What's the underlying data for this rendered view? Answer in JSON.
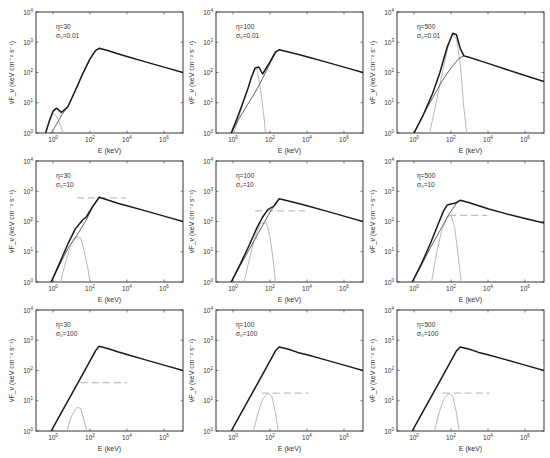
{
  "figure": {
    "xlabel": "E (keV)",
    "ylabel": "νF_ν (keV cm⁻² s⁻¹)",
    "x_ticks": [
      0,
      2,
      4,
      6
    ],
    "y_ticks": [
      0,
      1,
      2,
      3,
      4
    ],
    "xlim_log": [
      -0.92,
      7.03
    ],
    "ylim_log": [
      0,
      4
    ],
    "colors": {
      "total": "#1a1a1a",
      "component": "#555555",
      "thermal": "#b0b0b0",
      "dashed": "#c0c0c0",
      "axes": "#333333"
    }
  },
  "chart_data": [
    {
      "type": "line",
      "title": "",
      "row": 0,
      "col": 0,
      "label_eta": "η=30",
      "label_sigma": "σ₀=0.01",
      "xlabel": "E (keV)",
      "ylabel": "νFν (keV cm^-2 s^-1)",
      "xscale": "log",
      "yscale": "log",
      "xlim": [
        0.12,
        10000000.0
      ],
      "ylim": [
        1,
        10000
      ],
      "series": [
        {
          "name": "total",
          "x_log": [
            -0.4,
            -0.2,
            0.0,
            0.2,
            0.45,
            0.8,
            1.2,
            1.6,
            2.0,
            2.3,
            2.5,
            3.0,
            3.5,
            4.0,
            5.0,
            6.0,
            7.03
          ],
          "y_log": [
            0,
            0.4,
            0.72,
            0.82,
            0.68,
            0.86,
            1.4,
            1.95,
            2.45,
            2.72,
            2.8,
            2.72,
            2.62,
            2.53,
            2.35,
            2.18,
            2.0
          ]
        },
        {
          "name": "nonthermal",
          "x_log": [
            -0.1,
            0.2,
            0.5,
            0.8,
            1.2,
            1.6,
            2.0,
            2.3,
            2.5
          ],
          "y_log": [
            0,
            0.3,
            0.62,
            0.88,
            1.4,
            1.95,
            2.45,
            2.72,
            2.8
          ]
        },
        {
          "name": "thermal",
          "x_log": [
            -0.38,
            -0.2,
            0.0,
            0.2,
            0.4,
            0.55
          ],
          "y_log": [
            0,
            0.35,
            0.65,
            0.55,
            0.25,
            0
          ]
        }
      ],
      "dashed": null
    },
    {
      "type": "line",
      "title": "",
      "row": 0,
      "col": 1,
      "label_eta": "η=100",
      "label_sigma": "σ₀=0.01",
      "xlabel": "E (keV)",
      "ylabel": "νFν (keV cm^-2 s^-1)",
      "xscale": "log",
      "yscale": "log",
      "xlim": [
        0.12,
        10000000.0
      ],
      "ylim": [
        1,
        10000
      ],
      "series": [
        {
          "name": "total",
          "x_log": [
            -0.1,
            0.2,
            0.5,
            0.8,
            1.0,
            1.2,
            1.4,
            1.6,
            2.0,
            2.3,
            2.5,
            3.0,
            3.5,
            4.0,
            5.0,
            6.0,
            7.03
          ],
          "y_log": [
            0,
            0.45,
            0.95,
            1.45,
            1.85,
            2.15,
            2.18,
            1.95,
            2.35,
            2.68,
            2.75,
            2.68,
            2.6,
            2.52,
            2.35,
            2.18,
            2.0
          ]
        },
        {
          "name": "nonthermal",
          "x_log": [
            -0.1,
            0.3,
            0.8,
            1.2,
            1.6,
            2.0,
            2.3,
            2.5
          ],
          "y_log": [
            0,
            0.45,
            0.95,
            1.35,
            1.8,
            2.3,
            2.65,
            2.75
          ]
        },
        {
          "name": "thermal",
          "x_log": [
            0.05,
            0.3,
            0.6,
            0.9,
            1.15,
            1.3,
            1.5,
            1.7,
            1.75
          ],
          "y_log": [
            0,
            0.5,
            1.1,
            1.65,
            2.1,
            2.12,
            1.4,
            0.4,
            0
          ]
        }
      ],
      "dashed": null
    },
    {
      "type": "line",
      "title": "",
      "row": 0,
      "col": 2,
      "label_eta": "η=500",
      "label_sigma": "σ₀=0.01",
      "xlabel": "E (keV)",
      "ylabel": "νFν (keV cm^-2 s^-1)",
      "xscale": "log",
      "yscale": "log",
      "xlim": [
        0.12,
        10000000.0
      ],
      "ylim": [
        1,
        10000
      ],
      "series": [
        {
          "name": "total",
          "x_log": [
            0.0,
            0.5,
            1.0,
            1.4,
            1.8,
            2.1,
            2.3,
            2.5,
            2.7,
            3.0,
            3.5,
            4.0,
            5.0,
            6.0,
            7.03
          ],
          "y_log": [
            0,
            0.6,
            1.3,
            2.0,
            2.85,
            3.3,
            3.25,
            2.8,
            2.55,
            2.5,
            2.4,
            2.3,
            2.1,
            1.9,
            1.7
          ]
        },
        {
          "name": "nonthermal",
          "x_log": [
            0.0,
            0.5,
            1.0,
            1.5,
            2.0,
            2.4,
            2.7,
            3.0,
            3.5
          ],
          "y_log": [
            0,
            0.6,
            1.15,
            1.7,
            2.15,
            2.45,
            2.55,
            2.5,
            2.4
          ]
        },
        {
          "name": "thermal",
          "x_log": [
            0.85,
            1.2,
            1.6,
            1.9,
            2.1,
            2.3,
            2.5,
            2.7,
            2.85
          ],
          "y_log": [
            0,
            1.0,
            2.2,
            3.0,
            3.28,
            3.1,
            2.3,
            0.8,
            0
          ]
        }
      ],
      "dashed": null
    },
    {
      "type": "line",
      "title": "",
      "row": 1,
      "col": 0,
      "label_eta": "η=30",
      "label_sigma": "σ₀=10",
      "xlabel": "E (keV)",
      "ylabel": "νFν (keV cm^-2 s^-1)",
      "xscale": "log",
      "yscale": "log",
      "xlim": [
        0.12,
        10000000.0
      ],
      "ylim": [
        1,
        10000
      ],
      "series": [
        {
          "name": "total",
          "x_log": [
            -0.1,
            0.3,
            0.8,
            1.2,
            1.6,
            1.8,
            2.1,
            2.5,
            3.0,
            3.5,
            4.0,
            5.0,
            6.0,
            7.03
          ],
          "y_log": [
            0,
            0.55,
            1.25,
            1.75,
            2.05,
            2.15,
            2.45,
            2.8,
            2.7,
            2.6,
            2.52,
            2.35,
            2.18,
            2.0
          ]
        },
        {
          "name": "nonthermal",
          "x_log": [
            -0.1,
            0.3,
            0.8,
            1.3,
            1.8,
            2.2,
            2.5
          ],
          "y_log": [
            0,
            0.5,
            1.1,
            1.55,
            2.05,
            2.55,
            2.8
          ]
        },
        {
          "name": "thermal",
          "x_log": [
            0.4,
            0.7,
            1.0,
            1.3,
            1.5,
            1.7,
            1.9,
            2.0
          ],
          "y_log": [
            0,
            0.7,
            1.3,
            1.5,
            1.45,
            1.0,
            0.4,
            0
          ]
        }
      ],
      "dashed": {
        "x_log": [
          1.3,
          3.95
        ],
        "y_log": 2.78
      }
    },
    {
      "type": "line",
      "title": "",
      "row": 1,
      "col": 1,
      "label_eta": "η=100",
      "label_sigma": "σ₀=10",
      "xlabel": "E (keV)",
      "ylabel": "νFν (keV cm^-2 s^-1)",
      "xscale": "log",
      "yscale": "log",
      "xlim": [
        0.12,
        10000000.0
      ],
      "ylim": [
        1,
        10000
      ],
      "series": [
        {
          "name": "total",
          "x_log": [
            -0.1,
            0.4,
            0.9,
            1.3,
            1.6,
            1.9,
            2.2,
            2.5,
            3.0,
            3.5,
            4.0,
            5.0,
            6.0,
            7.03
          ],
          "y_log": [
            0,
            0.6,
            1.25,
            1.8,
            2.15,
            2.4,
            2.5,
            2.75,
            2.68,
            2.6,
            2.52,
            2.35,
            2.18,
            2.0
          ]
        },
        {
          "name": "nonthermal",
          "x_log": [
            -0.1,
            0.4,
            0.9,
            1.4,
            1.9,
            2.3,
            2.5
          ],
          "y_log": [
            0,
            0.55,
            1.1,
            1.65,
            2.2,
            2.6,
            2.75
          ]
        },
        {
          "name": "thermal",
          "x_log": [
            0.6,
            0.9,
            1.2,
            1.5,
            1.8,
            2.0,
            2.2,
            2.3
          ],
          "y_log": [
            0,
            0.8,
            1.5,
            1.95,
            1.95,
            1.5,
            0.6,
            0
          ]
        }
      ],
      "dashed": {
        "x_log": [
          1.2,
          3.9
        ],
        "y_log": 2.35
      }
    },
    {
      "type": "line",
      "title": "",
      "row": 1,
      "col": 2,
      "label_eta": "η=500",
      "label_sigma": "σ₀=10",
      "xlabel": "E (keV)",
      "ylabel": "νFν (keV cm^-2 s^-1)",
      "xscale": "log",
      "yscale": "log",
      "xlim": [
        0.12,
        10000000.0
      ],
      "ylim": [
        1,
        10000
      ],
      "series": [
        {
          "name": "total",
          "x_log": [
            -0.1,
            0.4,
            0.9,
            1.3,
            1.6,
            1.8,
            2.0,
            2.2,
            2.5,
            3.0,
            3.5,
            4.0,
            5.0,
            6.0,
            7.03
          ],
          "y_log": [
            0,
            0.6,
            1.3,
            1.9,
            2.35,
            2.55,
            2.58,
            2.6,
            2.7,
            2.62,
            2.52,
            2.42,
            2.25,
            2.1,
            1.95
          ]
        },
        {
          "name": "nonthermal",
          "x_log": [
            -0.1,
            0.4,
            0.9,
            1.4,
            1.9,
            2.3,
            2.5
          ],
          "y_log": [
            0,
            0.55,
            1.15,
            1.7,
            2.25,
            2.6,
            2.7
          ]
        },
        {
          "name": "thermal",
          "x_log": [
            0.95,
            1.2,
            1.5,
            1.8,
            2.0,
            2.2,
            2.4,
            2.55
          ],
          "y_log": [
            0,
            0.9,
            1.7,
            2.15,
            2.2,
            1.8,
            0.8,
            0
          ]
        }
      ],
      "dashed": {
        "x_log": [
          1.9,
          3.95
        ],
        "y_log": 2.2
      }
    },
    {
      "type": "line",
      "title": "",
      "row": 2,
      "col": 0,
      "label_eta": "η=30",
      "label_sigma": "σ₀=100",
      "xlabel": "E (keV)",
      "ylabel": "νFν (keV cm^-2 s^-1)",
      "xscale": "log",
      "yscale": "log",
      "xlim": [
        0.12,
        10000000.0
      ],
      "ylim": [
        1,
        10000
      ],
      "series": [
        {
          "name": "total",
          "x_log": [
            -0.1,
            0.4,
            0.9,
            1.4,
            1.9,
            2.3,
            2.5,
            3.0,
            3.5,
            4.0,
            5.0,
            6.0,
            7.03
          ],
          "y_log": [
            0,
            0.55,
            1.1,
            1.65,
            2.2,
            2.65,
            2.8,
            2.72,
            2.62,
            2.53,
            2.35,
            2.18,
            2.0
          ]
        },
        {
          "name": "thermal",
          "x_log": [
            0.75,
            1.0,
            1.3,
            1.5,
            1.7,
            1.85
          ],
          "y_log": [
            0,
            0.5,
            0.78,
            0.75,
            0.3,
            0
          ]
        }
      ],
      "dashed": {
        "x_log": [
          1.5,
          4.0
        ],
        "y_log": 1.6
      }
    },
    {
      "type": "line",
      "title": "",
      "row": 2,
      "col": 1,
      "label_eta": "η=100",
      "label_sigma": "σ₀=100",
      "xlabel": "E (keV)",
      "ylabel": "νFν (keV cm^-2 s^-1)",
      "xscale": "log",
      "yscale": "log",
      "xlim": [
        0.12,
        10000000.0
      ],
      "ylim": [
        1,
        10000
      ],
      "series": [
        {
          "name": "total",
          "x_log": [
            -0.1,
            0.4,
            0.9,
            1.4,
            1.9,
            2.3,
            2.5,
            3.0,
            3.5,
            4.0,
            5.0,
            6.0,
            7.03
          ],
          "y_log": [
            0,
            0.55,
            1.1,
            1.65,
            2.2,
            2.65,
            2.78,
            2.7,
            2.6,
            2.52,
            2.35,
            2.18,
            2.0
          ]
        },
        {
          "name": "thermal",
          "x_log": [
            1.1,
            1.35,
            1.6,
            1.9,
            2.1,
            2.3,
            2.45
          ],
          "y_log": [
            0,
            0.6,
            1.05,
            1.25,
            1.15,
            0.6,
            0
          ]
        }
      ],
      "dashed": {
        "x_log": [
          1.55,
          4.1
        ],
        "y_log": 1.25
      }
    },
    {
      "type": "line",
      "title": "",
      "row": 2,
      "col": 2,
      "label_eta": "η=500",
      "label_sigma": "σ₀=100",
      "xlabel": "E (keV)",
      "ylabel": "νFν (keV cm^-2 s^-1)",
      "xscale": "log",
      "yscale": "log",
      "xlim": [
        0.12,
        10000000.0
      ],
      "ylim": [
        1,
        10000
      ],
      "series": [
        {
          "name": "total",
          "x_log": [
            -0.1,
            0.4,
            0.9,
            1.4,
            1.9,
            2.3,
            2.5,
            3.0,
            3.5,
            4.0,
            5.0,
            6.0,
            7.03
          ],
          "y_log": [
            0,
            0.55,
            1.1,
            1.65,
            2.2,
            2.65,
            2.78,
            2.7,
            2.6,
            2.52,
            2.35,
            2.18,
            2.0
          ]
        },
        {
          "name": "thermal",
          "x_log": [
            1.1,
            1.35,
            1.6,
            1.9,
            2.1,
            2.3,
            2.45
          ],
          "y_log": [
            0,
            0.6,
            1.05,
            1.25,
            1.15,
            0.6,
            0
          ]
        }
      ],
      "dashed": {
        "x_log": [
          1.55,
          4.1
        ],
        "y_log": 1.25
      }
    }
  ]
}
